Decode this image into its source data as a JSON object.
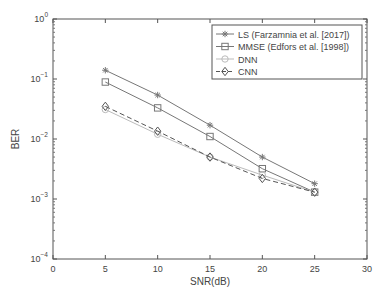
{
  "chart_data": {
    "type": "line",
    "title": "",
    "xlabel": "SNR(dB)",
    "ylabel": "BER",
    "xlim": [
      0,
      30
    ],
    "ylim": [
      0.0001,
      1
    ],
    "yscale": "log",
    "x_ticks": [
      "0",
      "5",
      "10",
      "15",
      "20",
      "25",
      "30"
    ],
    "y_ticks": [
      {
        "base": "10",
        "exp": "0"
      },
      {
        "base": "10",
        "exp": "−1"
      },
      {
        "base": "10",
        "exp": "−2"
      },
      {
        "base": "10",
        "exp": "−3"
      },
      {
        "base": "10",
        "exp": "−4"
      }
    ],
    "grid": false,
    "legend_position": "upper right",
    "x": [
      5,
      10,
      15,
      20,
      25
    ],
    "series": [
      {
        "name": "LS (Farzamnia et al. [2017])",
        "marker": "asterisk",
        "dash": "solid",
        "color": "#777777",
        "values": [
          0.14,
          0.054,
          0.017,
          0.005,
          0.0018
        ]
      },
      {
        "name": "MMSE (Edfors et al. [1998])",
        "marker": "square",
        "dash": "solid",
        "color": "#777777",
        "values": [
          0.089,
          0.033,
          0.011,
          0.0032,
          0.0013
        ]
      },
      {
        "name": "DNN",
        "marker": "circle",
        "dash": "solid",
        "color": "#bbbbbb",
        "values": [
          0.031,
          0.012,
          0.005,
          0.0025,
          0.0013
        ]
      },
      {
        "name": "CNN",
        "marker": "diamond",
        "dash": "dashed",
        "color": "#555555",
        "values": [
          0.035,
          0.0135,
          0.005,
          0.0022,
          0.0013
        ]
      }
    ]
  }
}
